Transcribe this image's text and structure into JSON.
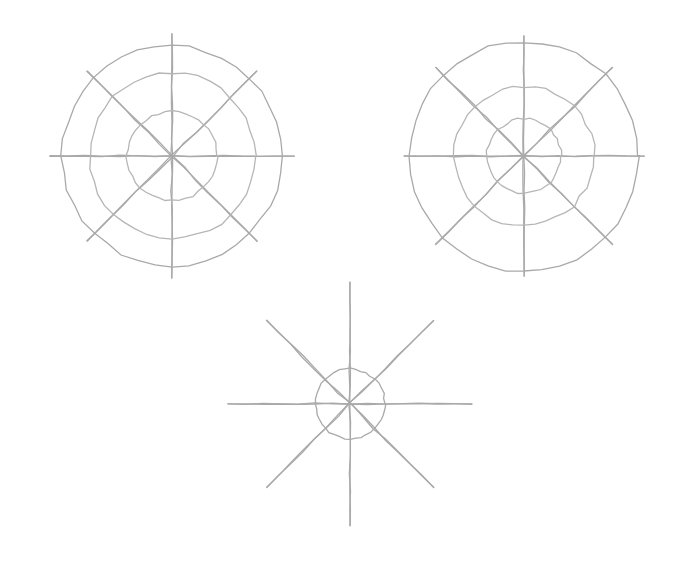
{
  "document": {
    "title": "Polar Grid Sketches",
    "background_color": "#ffffff",
    "width": 687,
    "height": 563,
    "medium": "hand-drawn pencil sketch",
    "stroke_color": "#a9a9a9",
    "stroke_color_light": "#b6b6b6",
    "stroke_width": 1.3
  },
  "chart_data": {
    "type": "scatter",
    "xlabel": "",
    "ylabel": "",
    "grid": true,
    "legend": false,
    "figure_count": 3,
    "figures": [
      {
        "name": "top-left-polar-grid",
        "label": "Top-left polar grid",
        "center_x": 172,
        "center_y": 156,
        "ring_count": 3,
        "ring_radii": [
          110,
          83,
          45
        ],
        "spoke_count": 8,
        "spoke_angles_deg": [
          0,
          45,
          90,
          135,
          180,
          225,
          270,
          315
        ],
        "axis_half_length": 122,
        "diagonal_half_length": 120,
        "axis_extends_past_outer_ring": true
      },
      {
        "name": "top-right-polar-grid",
        "label": "Top-right polar grid",
        "center_x": 524,
        "center_y": 156,
        "ring_count": 3,
        "ring_radii": [
          115,
          70,
          37
        ],
        "spoke_count": 8,
        "spoke_angles_deg": [
          0,
          45,
          90,
          135,
          180,
          225,
          270,
          315
        ],
        "axis_half_length": 120,
        "diagonal_half_length": 125,
        "axis_extends_past_outer_ring": true
      },
      {
        "name": "bottom-center-star-grid",
        "label": "Bottom-center single-ring star grid",
        "center_x": 350,
        "center_y": 404,
        "ring_count": 1,
        "ring_radii": [
          35
        ],
        "spoke_count": 8,
        "spoke_angles_deg": [
          0,
          45,
          90,
          135,
          180,
          225,
          270,
          315
        ],
        "axis_half_length": 122,
        "diagonal_half_length": 118,
        "axis_extends_past_outer_ring": true
      }
    ]
  }
}
